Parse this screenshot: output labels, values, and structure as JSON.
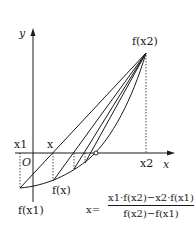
{
  "diagram": {
    "axes": {
      "x_label": "x",
      "y_label": "y",
      "origin_label": "O"
    },
    "labels": {
      "x1_axis": "x1",
      "x_axis_point": "x",
      "x2_axis": "x2",
      "f_x2": "f(x2)",
      "f_x1": "f(x1)",
      "f_x": "f(x)"
    },
    "formula": {
      "lhs": "x=",
      "numerator": "x1·f(x2)−x2·f(x1)",
      "denominator": "f(x2)−f(x1)"
    },
    "colors": {
      "ink": "#1a1a1a",
      "background": "#ffffff"
    }
  }
}
